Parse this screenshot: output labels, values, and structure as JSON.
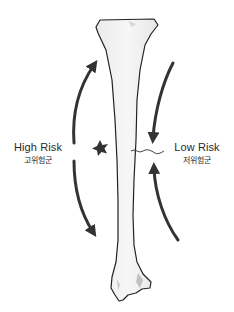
{
  "labels": {
    "high_risk": {
      "en": "High Risk",
      "ko": "고위험군"
    },
    "low_risk": {
      "en": "Low Risk",
      "ko": "저위험군"
    }
  },
  "colors": {
    "arrow": "#333333",
    "bone_fill": "#f2f2f2",
    "bone_outline": "#222222",
    "text": "#2a2a2a"
  },
  "illustration": {
    "subject": "tibia-bone",
    "markers": [
      "star-marker",
      "fracture-line"
    ]
  }
}
